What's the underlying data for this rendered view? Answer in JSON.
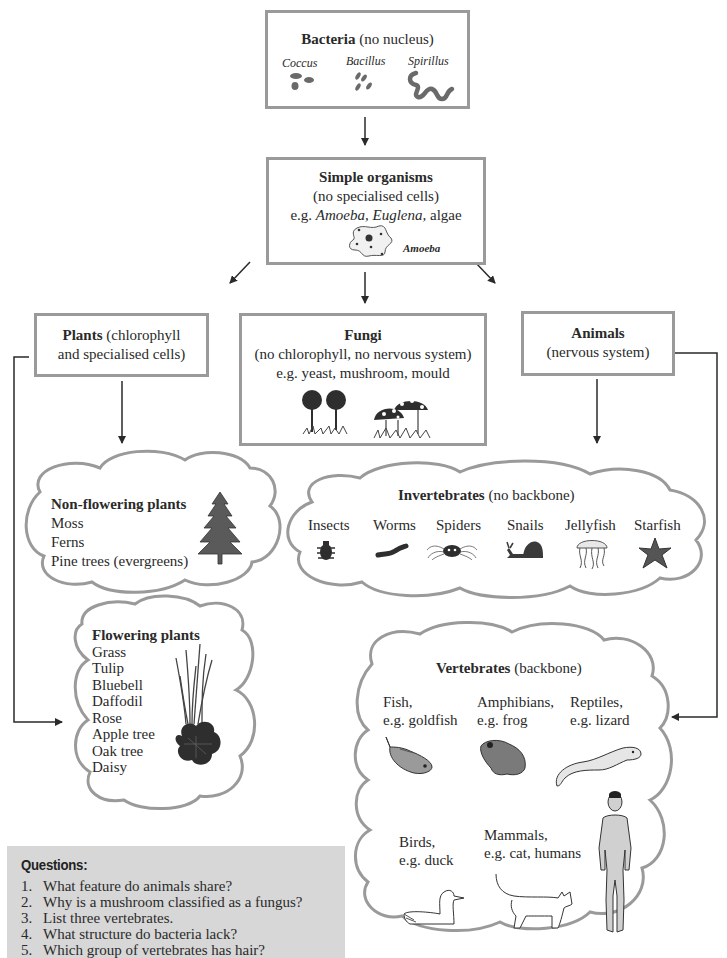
{
  "bacteria": {
    "title": "Bacteria",
    "subtitle": "(no nucleus)",
    "types": [
      {
        "label": "Coccus",
        "icon": "coccus-icon"
      },
      {
        "label": "Bacillus",
        "icon": "bacillus-icon"
      },
      {
        "label": "Spirillus",
        "icon": "spirillus-icon"
      }
    ]
  },
  "simple": {
    "title": "Simple organisms",
    "line2": "(no specialised cells)",
    "eg_prefix": "e.g. ",
    "eg_1": "Amoeba,",
    "eg_2": "Euglena,",
    "eg_3": "algae",
    "image_label": "Amoeba"
  },
  "plants": {
    "title": "Plants",
    "line1_rest": "(chlorophyll",
    "line2": "and specialised cells)"
  },
  "fungi": {
    "title": "Fungi",
    "line2": "(no chlorophyll, no nervous system)",
    "line3": "e.g. yeast, mushroom, mould"
  },
  "animals": {
    "title": "Animals",
    "line2": "(nervous system)"
  },
  "non_flowering": {
    "title": "Non-flowering plants",
    "items": [
      "Moss",
      "Ferns",
      "Pine trees (evergreens)"
    ]
  },
  "flowering": {
    "title": "Flowering plants",
    "items": [
      "Grass",
      "Tulip",
      "Bluebell",
      "Daffodil",
      "Rose",
      "Apple tree",
      "Oak tree",
      "Daisy"
    ]
  },
  "invertebrates": {
    "title": "Invertebrates",
    "subtitle": "(no backbone)",
    "items": [
      {
        "label": "Insects",
        "icon": "insect-icon"
      },
      {
        "label": "Worms",
        "icon": "worm-icon"
      },
      {
        "label": "Spiders",
        "icon": "spider-icon"
      },
      {
        "label": "Snails",
        "icon": "snail-icon"
      },
      {
        "label": "Jellyfish",
        "icon": "jellyfish-icon"
      },
      {
        "label": "Starfish",
        "icon": "starfish-icon"
      }
    ]
  },
  "vertebrates": {
    "title": "Vertebrates",
    "subtitle": "(backbone)",
    "groups": [
      {
        "line1": "Fish,",
        "line2": "e.g. goldfish",
        "icon": "fish-icon"
      },
      {
        "line1": "Amphibians,",
        "line2": "e.g. frog",
        "icon": "frog-icon"
      },
      {
        "line1": "Reptiles,",
        "line2": "e.g. lizard",
        "icon": "lizard-icon"
      },
      {
        "line1": "Birds,",
        "line2": "e.g. duck",
        "icon": "duck-icon"
      },
      {
        "line1": "Mammals,",
        "line2": "e.g. cat, humans",
        "icon": "cat-icon"
      }
    ]
  },
  "questions": {
    "title": "Questions:",
    "items": [
      {
        "num": "1.",
        "text": "What feature do animals share?"
      },
      {
        "num": "2.",
        "text": "Why is a mushroom classified as a fungus?"
      },
      {
        "num": "3.",
        "text": "List three vertebrates."
      },
      {
        "num": "4.",
        "text": "What structure do bacteria lack?"
      },
      {
        "num": "5.",
        "text": "Which group of vertebrates has hair?"
      }
    ]
  },
  "colors": {
    "box_border": "#9a9a9a",
    "line": "#2a2a2a",
    "question_bg": "#d7d7d7",
    "icon_dark": "#3a3a3a",
    "icon_mid": "#8a8a8a"
  }
}
